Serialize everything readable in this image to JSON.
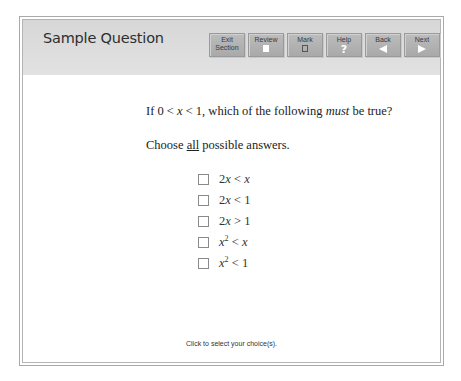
{
  "header": {
    "title": "Sample Question",
    "buttons": [
      {
        "id": "exit",
        "label_line1": "Exit",
        "label_line2": "Section",
        "icon": "none"
      },
      {
        "id": "review",
        "label": "Review",
        "icon": "review-page-icon"
      },
      {
        "id": "mark",
        "label": "Mark",
        "icon": "mark-box-icon"
      },
      {
        "id": "help",
        "label": "Help",
        "icon": "question-mark-icon",
        "glyph": "?"
      },
      {
        "id": "back",
        "label": "Back",
        "icon": "left-arrow-icon"
      },
      {
        "id": "next",
        "label": "Next",
        "icon": "right-arrow-icon"
      }
    ]
  },
  "question": {
    "stem_prefix": "If 0 < ",
    "stem_var": "x",
    "stem_mid": " < 1, which of the following ",
    "stem_emph": "must",
    "stem_suffix": " be true?",
    "instruction_prefix": "Choose ",
    "instruction_emph": "all",
    "instruction_suffix": " possible answers.",
    "choices": [
      {
        "pre": "2",
        "var": "x",
        "sup": "",
        "op": " < ",
        "rhs": "x",
        "rhs_italic": true,
        "checked": false
      },
      {
        "pre": "2",
        "var": "x",
        "sup": "",
        "op": " < ",
        "rhs": "1",
        "rhs_italic": false,
        "checked": false
      },
      {
        "pre": "2",
        "var": "x",
        "sup": "",
        "op": " > ",
        "rhs": "1",
        "rhs_italic": false,
        "checked": false
      },
      {
        "pre": "",
        "var": "x",
        "sup": "2",
        "op": " < ",
        "rhs": "x",
        "rhs_italic": true,
        "checked": false
      },
      {
        "pre": "",
        "var": "x",
        "sup": "2",
        "op": " < ",
        "rhs": "1",
        "rhs_italic": false,
        "checked": false
      }
    ]
  },
  "footer": {
    "hint": "Click to select your choice(s)."
  },
  "colors": {
    "header_bg": "#dcdcdc",
    "button_bg": "#b3b3b3",
    "border": "#a9a9a9"
  }
}
